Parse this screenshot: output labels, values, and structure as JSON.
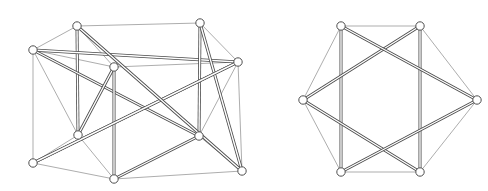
{
  "figure": {
    "background_color": "#ffffff",
    "width": 488,
    "height": 191,
    "panel_labels": [
      "left-layout",
      "right-layout"
    ]
  },
  "style": {
    "thin_edge_color": "#8a8a8a",
    "thick_edge_color": "#4a4a4a",
    "node_fill_color": "#ffffff",
    "node_stroke_color": "#4f4f4f",
    "node_radius": 4.2,
    "thin_edge_width": 0.7,
    "thick_edge_width": 3.0
  },
  "chart_data": {
    "type": "diagram",
    "subtype": "node-link-graph",
    "xlabel": "",
    "ylabel": "",
    "grid": false,
    "legend": "none",
    "graphs": [
      {
        "name": "left-layout",
        "node_count": 10,
        "edge_count": 21,
        "nodes": [
          {
            "id": "L0",
            "x": 77,
            "y": 26
          },
          {
            "id": "L1",
            "x": 33,
            "y": 50
          },
          {
            "id": "L2",
            "x": 114,
            "y": 67
          },
          {
            "id": "L3",
            "x": 200,
            "y": 23
          },
          {
            "id": "L4",
            "x": 238,
            "y": 62
          },
          {
            "id": "L5",
            "x": 78,
            "y": 135
          },
          {
            "id": "L6",
            "x": 199,
            "y": 136
          },
          {
            "id": "L7",
            "x": 33,
            "y": 163
          },
          {
            "id": "L8",
            "x": 114,
            "y": 179
          },
          {
            "id": "L9",
            "x": 242,
            "y": 171
          }
        ],
        "thin_edges": [
          [
            "L0",
            "L1"
          ],
          [
            "L0",
            "L3"
          ],
          [
            "L0",
            "L2"
          ],
          [
            "L1",
            "L2"
          ],
          [
            "L1",
            "L4"
          ],
          [
            "L1",
            "L5"
          ],
          [
            "L1",
            "L7"
          ],
          [
            "L3",
            "L4"
          ],
          [
            "L2",
            "L4"
          ],
          [
            "L3",
            "L9"
          ],
          [
            "L4",
            "L9"
          ],
          [
            "L4",
            "L6"
          ],
          [
            "L5",
            "L7"
          ],
          [
            "L5",
            "L8"
          ],
          [
            "L6",
            "L9"
          ],
          [
            "L7",
            "L8"
          ],
          [
            "L8",
            "L9"
          ],
          [
            "L2",
            "L5"
          ],
          [
            "L6",
            "L8"
          ],
          [
            "L3",
            "L6"
          ],
          [
            "L0",
            "L5"
          ]
        ],
        "thick_edges": [
          [
            "L0",
            "L5"
          ],
          [
            "L1",
            "L4"
          ],
          [
            "L1",
            "L6"
          ],
          [
            "L2",
            "L5"
          ],
          [
            "L2",
            "L8"
          ],
          [
            "L3",
            "L6"
          ],
          [
            "L3",
            "L9"
          ],
          [
            "L4",
            "L7"
          ],
          [
            "L6",
            "L8"
          ],
          [
            "L7",
            "L4"
          ],
          [
            "L9",
            "L0"
          ]
        ]
      },
      {
        "name": "right-layout",
        "node_count": 6,
        "edge_count": 12,
        "nodes": [
          {
            "id": "R0",
            "x": 341,
            "y": 26
          },
          {
            "id": "R1",
            "x": 420,
            "y": 26
          },
          {
            "id": "R2",
            "x": 477,
            "y": 100
          },
          {
            "id": "R3",
            "x": 420,
            "y": 172
          },
          {
            "id": "R4",
            "x": 341,
            "y": 172
          },
          {
            "id": "R5",
            "x": 303,
            "y": 100
          }
        ],
        "thin_edges": [
          [
            "R0",
            "R1"
          ],
          [
            "R1",
            "R2"
          ],
          [
            "R2",
            "R3"
          ],
          [
            "R3",
            "R4"
          ],
          [
            "R4",
            "R5"
          ],
          [
            "R5",
            "R0"
          ]
        ],
        "thick_edges": [
          [
            "R0",
            "R4"
          ],
          [
            "R1",
            "R3"
          ],
          [
            "R5",
            "R1"
          ],
          [
            "R5",
            "R3"
          ],
          [
            "R2",
            "R0"
          ],
          [
            "R2",
            "R4"
          ]
        ]
      }
    ]
  }
}
